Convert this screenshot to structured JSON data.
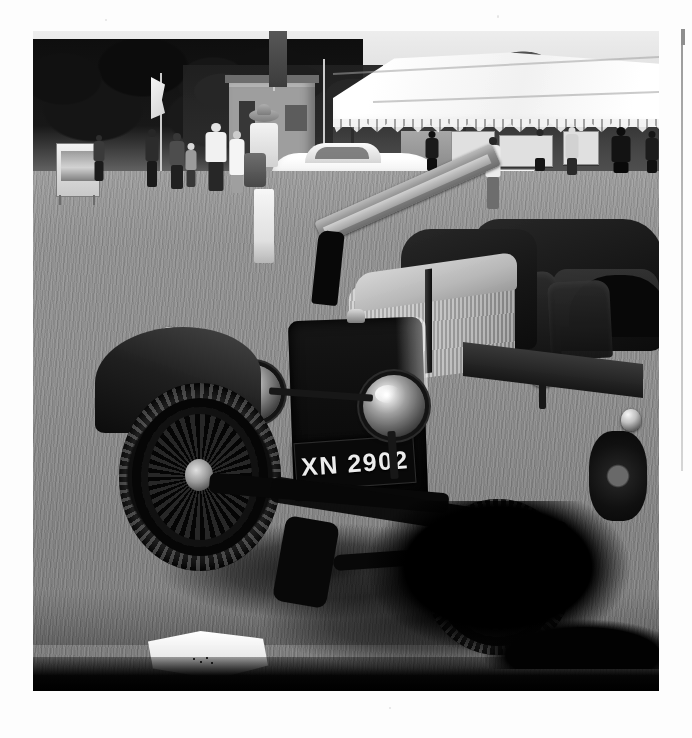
{
  "page": {
    "background_color": "#fdfdfd",
    "kind": "scanned-book-page",
    "right_rule_color": "#9a9a9a"
  },
  "photograph": {
    "name": "vintage-car-at-concours-photo",
    "alt": "Black and white photograph of a vintage open-top motor car displayed on grass at a classic car show, with a white marquee, flags and spectators behind",
    "treatment": "black-and-white",
    "frame": {
      "x": 33,
      "y": 31,
      "width": 626,
      "height": 660
    },
    "subject": {
      "vehicle": "vintage open tourer motor car",
      "registration_plate": "XN 2902",
      "features": [
        "twin nickel headlamps",
        "tall black radiator shell",
        "ribbed light-grey bonnet",
        "wire-spoke wheels",
        "folded windscreen",
        "leather bucket seats"
      ]
    },
    "background_elements": [
      "white marquee with scalloped valance",
      "wooden hut with door and window",
      "dark treeline",
      "white flag on pole",
      "dark banner on pole",
      "modern white sports car",
      "display boards and signs",
      "spectators on grass",
      "woman in white with wide-brim hat"
    ],
    "foreground_elements": [
      "white folded card lying on the grass",
      "car shadow cast across the grass"
    ]
  },
  "annotations": {
    "plate_label": "XN 2902"
  }
}
